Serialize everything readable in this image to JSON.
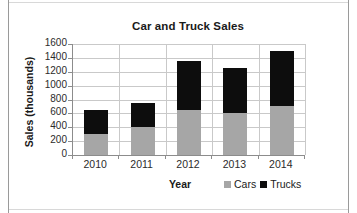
{
  "chart_data": {
    "type": "bar",
    "subtype": "stacked-vertical",
    "title": "Car and Truck Sales",
    "xlabel": "Year",
    "ylabel": "Sales (thousands)",
    "categories": [
      "2010",
      "2011",
      "2012",
      "2013",
      "2014"
    ],
    "series": [
      {
        "name": "Cars",
        "color": "#a6a6a6",
        "values": [
          300,
          400,
          650,
          600,
          700
        ]
      },
      {
        "name": "Trucks",
        "color": "#0d0d0d",
        "values": [
          350,
          350,
          700,
          650,
          800
        ]
      }
    ],
    "totals": [
      650,
      750,
      1350,
      1250,
      1500
    ],
    "ylim": [
      0,
      1600
    ],
    "ytick_values": [
      0,
      200,
      400,
      600,
      800,
      1000,
      1200,
      1400,
      1600
    ],
    "ytick_labels": [
      "0",
      "200",
      "400",
      "600",
      "800",
      "1000",
      "1200",
      "1400",
      "1600"
    ],
    "grid": "horizontal-and-vertical",
    "legend_position": "bottom-right",
    "legend_entries": [
      "Cars",
      "Trucks"
    ]
  },
  "colors": {
    "cars": "#a6a6a6",
    "trucks": "#0d0d0d",
    "gridline": "#c9c9c9",
    "axis": "#8c8c8c",
    "text": "#1a1a1a",
    "background": "#ffffff"
  }
}
